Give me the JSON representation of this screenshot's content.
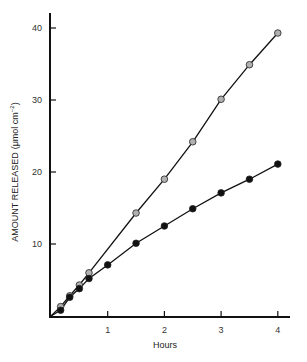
{
  "chart_data": {
    "type": "line",
    "title": "",
    "xlabel": "Hours",
    "ylabel": "AMOUNT RELEASED (μmol cm⁻²)",
    "ylabel_main": "AMOUNT RELEASED",
    "ylabel_unit": "(μmol cm",
    "ylabel_exp": "−2",
    "ylabel_close": ")",
    "xlim": [
      0,
      4.25
    ],
    "ylim": [
      0,
      42
    ],
    "xticks": [
      1,
      2,
      3,
      4
    ],
    "xtick_labels": [
      "1",
      "2",
      "3",
      "4"
    ],
    "yticks": [
      10,
      20,
      30,
      40
    ],
    "ytick_labels": [
      "10",
      "20",
      "30",
      "40"
    ],
    "grid": false,
    "legend": null,
    "series": [
      {
        "name": "grey-circles",
        "marker": "circle",
        "color": "#b0b0b0",
        "x": [
          0.17,
          0.33,
          0.5,
          0.67,
          1.5,
          2.0,
          2.5,
          3.0,
          3.5,
          4.0
        ],
        "values": [
          1.3,
          2.8,
          4.3,
          6.0,
          14.3,
          19.0,
          24.2,
          30.1,
          34.9,
          39.3
        ]
      },
      {
        "name": "black-circles",
        "marker": "circle",
        "color": "#111111",
        "x": [
          0.17,
          0.33,
          0.5,
          0.67,
          1.0,
          1.5,
          2.0,
          2.5,
          3.0,
          3.5,
          4.0
        ],
        "values": [
          0.8,
          2.6,
          3.8,
          5.2,
          7.1,
          10.1,
          12.5,
          14.9,
          17.1,
          19.0,
          21.1
        ]
      }
    ]
  }
}
